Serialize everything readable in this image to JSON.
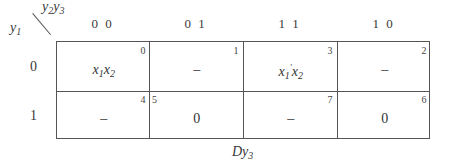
{
  "kmap": {
    "corner": {
      "col_var": "y2y3",
      "row_var": "y1"
    },
    "columns": [
      "0 0",
      "0 1",
      "1 1",
      "1 0"
    ],
    "rows": [
      "0",
      "1"
    ],
    "cells": [
      [
        {
          "index": "0",
          "value": "x1x2"
        },
        {
          "index": "1",
          "value": "–"
        },
        {
          "index": "3",
          "value": "x1'x2"
        },
        {
          "index": "2",
          "value": "–"
        }
      ],
      [
        {
          "index": "4",
          "value": "–"
        },
        {
          "index": "5",
          "value": "0"
        },
        {
          "index": "7",
          "value": "–"
        },
        {
          "index": "6",
          "value": "0"
        }
      ]
    ],
    "caption": "Dy3"
  }
}
